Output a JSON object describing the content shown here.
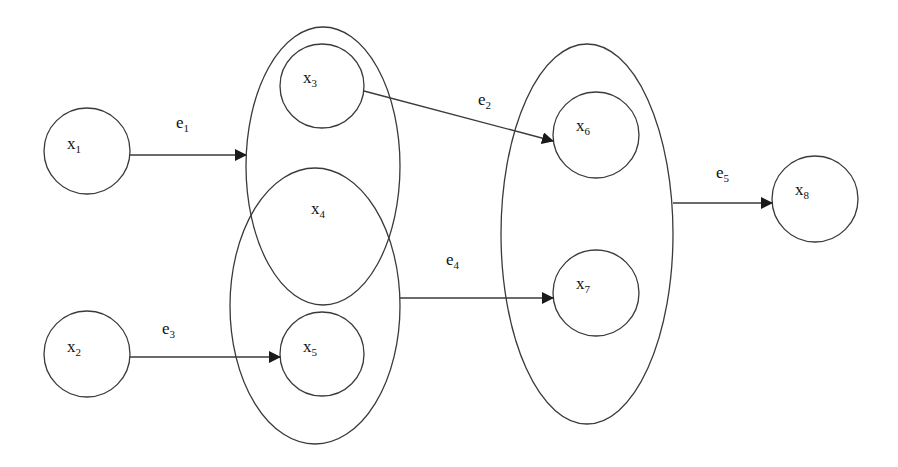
{
  "diagram": {
    "type": "hypergraph",
    "canvas": {
      "width": 898,
      "height": 467,
      "background": "#ffffff"
    },
    "stroke_color": "#3a3a3a",
    "nodes": [
      {
        "id": "x1",
        "base": "x",
        "sub": "1",
        "cx": 87,
        "cy": 151,
        "r": 43
      },
      {
        "id": "x2",
        "base": "x",
        "sub": "2",
        "cx": 87,
        "cy": 354,
        "r": 43
      },
      {
        "id": "x3",
        "base": "x",
        "sub": "3",
        "cx": 322,
        "cy": 86,
        "r": 42
      },
      {
        "id": "x4",
        "base": "x",
        "sub": "4",
        "label_only": true,
        "lx": 311,
        "ly": 214
      },
      {
        "id": "x5",
        "base": "x",
        "sub": "5",
        "cx": 322,
        "cy": 354,
        "r": 42
      },
      {
        "id": "x6",
        "base": "x",
        "sub": "6",
        "cx": 596,
        "cy": 135,
        "r": 43
      },
      {
        "id": "x7",
        "base": "x",
        "sub": "7",
        "cx": 596,
        "cy": 293,
        "r": 43
      },
      {
        "id": "x8",
        "base": "x",
        "sub": "8",
        "cx": 815,
        "cy": 199,
        "r": 43
      }
    ],
    "groups": [
      {
        "id": "group-x3-x4",
        "members": [
          "x3",
          "x4"
        ],
        "cx": 323,
        "cy": 166,
        "rx": 77,
        "ry": 139
      },
      {
        "id": "group-x4-x5",
        "members": [
          "x4",
          "x5"
        ],
        "cx": 315,
        "cy": 306,
        "rx": 85,
        "ry": 138
      },
      {
        "id": "group-x6-x7",
        "members": [
          "x6",
          "x7"
        ],
        "cx": 587,
        "cy": 234,
        "rx": 86,
        "ry": 190
      }
    ],
    "edges": [
      {
        "id": "e1",
        "base": "e",
        "sub": "1",
        "from": "x1",
        "to": "group-x3-x4",
        "x1": 130,
        "y1": 155,
        "x2": 246,
        "y2": 155,
        "lx": 176,
        "ly": 128
      },
      {
        "id": "e2",
        "base": "e",
        "sub": "2",
        "from": "x3",
        "to": "x6",
        "x1": 364,
        "y1": 91,
        "x2": 553,
        "y2": 141,
        "lx": 478,
        "ly": 105
      },
      {
        "id": "e3",
        "base": "e",
        "sub": "3",
        "from": "x2",
        "to": "x5",
        "x1": 130,
        "y1": 357,
        "x2": 280,
        "y2": 357,
        "lx": 162,
        "ly": 334
      },
      {
        "id": "e4",
        "base": "e",
        "sub": "4",
        "from": "group-x4-x5",
        "to": "x7",
        "x1": 400,
        "y1": 298,
        "x2": 553,
        "y2": 298,
        "lx": 446,
        "ly": 265
      },
      {
        "id": "e5",
        "base": "e",
        "sub": "5",
        "from": "group-x6-x7",
        "to": "x8",
        "x1": 673,
        "y1": 203,
        "x2": 772,
        "y2": 203,
        "lx": 716,
        "ly": 178
      }
    ]
  },
  "labels": {
    "x1": {
      "base": "x",
      "sub": "1"
    },
    "x2": {
      "base": "x",
      "sub": "2"
    },
    "x3": {
      "base": "x",
      "sub": "3"
    },
    "x4": {
      "base": "x",
      "sub": "4"
    },
    "x5": {
      "base": "x",
      "sub": "5"
    },
    "x6": {
      "base": "x",
      "sub": "6"
    },
    "x7": {
      "base": "x",
      "sub": "7"
    },
    "x8": {
      "base": "x",
      "sub": "8"
    },
    "e1": {
      "base": "e",
      "sub": "1"
    },
    "e2": {
      "base": "e",
      "sub": "2"
    },
    "e3": {
      "base": "e",
      "sub": "3"
    },
    "e4": {
      "base": "e",
      "sub": "4"
    },
    "e5": {
      "base": "e",
      "sub": "5"
    }
  }
}
